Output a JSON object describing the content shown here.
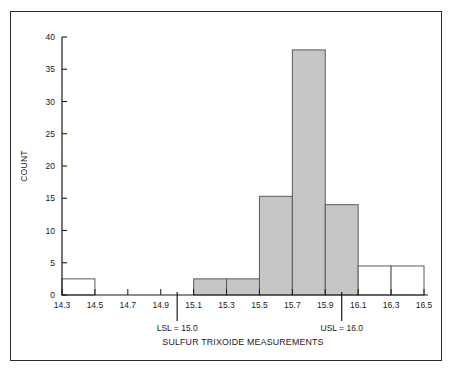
{
  "figure": {
    "background_color": "#ffffff",
    "frame_color": "#2b2b2b",
    "axis_color": "#1a1a1a"
  },
  "chart_data": {
    "type": "bar",
    "title": "",
    "subtitle": "",
    "xlabel": "SULFUR TRIXOIDE MEASUREMENTS",
    "ylabel": "COUNT",
    "xlim": [
      14.3,
      16.5
    ],
    "ylim": [
      0,
      40
    ],
    "grid": false,
    "legend": null,
    "bin_width": 0.2,
    "x_tick_labels": [
      "14.3",
      "14.5",
      "14.7",
      "14.9",
      "15.1",
      "15.3",
      "15.5",
      "15.7",
      "15.9",
      "16.1",
      "16.3",
      "16.5"
    ],
    "x_tick_values": [
      14.3,
      14.5,
      14.7,
      14.9,
      15.1,
      15.3,
      15.5,
      15.7,
      15.9,
      16.1,
      16.3,
      16.5
    ],
    "y_tick_labels": [
      "0",
      "5",
      "10",
      "15",
      "20",
      "25",
      "30",
      "35",
      "40"
    ],
    "y_tick_values": [
      0,
      5,
      10,
      15,
      20,
      25,
      30,
      35,
      40
    ],
    "bins": [
      {
        "x0": 14.3,
        "x1": 14.5,
        "count": 2.5,
        "fill": "#ffffff",
        "in_spec": false
      },
      {
        "x0": 14.5,
        "x1": 14.7,
        "count": 0,
        "fill": "#ffffff",
        "in_spec": false
      },
      {
        "x0": 14.7,
        "x1": 14.9,
        "count": 0,
        "fill": "#ffffff",
        "in_spec": false
      },
      {
        "x0": 14.9,
        "x1": 15.1,
        "count": 0,
        "fill": "#ffffff",
        "in_spec": false
      },
      {
        "x0": 15.1,
        "x1": 15.3,
        "count": 2.5,
        "fill": "#c6c6c6",
        "in_spec": true
      },
      {
        "x0": 15.3,
        "x1": 15.5,
        "count": 2.5,
        "fill": "#c6c6c6",
        "in_spec": true
      },
      {
        "x0": 15.5,
        "x1": 15.7,
        "count": 15.3,
        "fill": "#c6c6c6",
        "in_spec": true
      },
      {
        "x0": 15.7,
        "x1": 15.9,
        "count": 38.0,
        "fill": "#c6c6c6",
        "in_spec": true
      },
      {
        "x0": 15.9,
        "x1": 16.1,
        "count": 14.0,
        "fill": "#c6c6c6",
        "in_spec": true
      },
      {
        "x0": 16.1,
        "x1": 16.3,
        "count": 4.5,
        "fill": "#ffffff",
        "in_spec": false
      },
      {
        "x0": 16.3,
        "x1": 16.5,
        "count": 4.5,
        "fill": "#ffffff",
        "in_spec": false
      }
    ],
    "categories": [
      "14.3-14.5",
      "14.5-14.7",
      "14.7-14.9",
      "14.9-15.1",
      "15.1-15.3",
      "15.3-15.5",
      "15.5-15.7",
      "15.7-15.9",
      "15.9-16.1",
      "16.1-16.3",
      "16.3-16.5"
    ],
    "values": [
      2.5,
      0,
      0,
      0,
      2.5,
      2.5,
      15.3,
      38.0,
      14.0,
      4.5,
      4.5
    ],
    "annotations": [
      {
        "name": "lsl",
        "label": "LSL = 15.0",
        "x": 15.0,
        "value": 15.0
      },
      {
        "name": "usl",
        "label": "USL = 16.0",
        "x": 16.0,
        "value": 16.0
      }
    ],
    "bar_fill_in_spec": "#c6c6c6",
    "bar_fill_out_spec": "#ffffff",
    "bar_edge_color": "#5a5a5a"
  }
}
